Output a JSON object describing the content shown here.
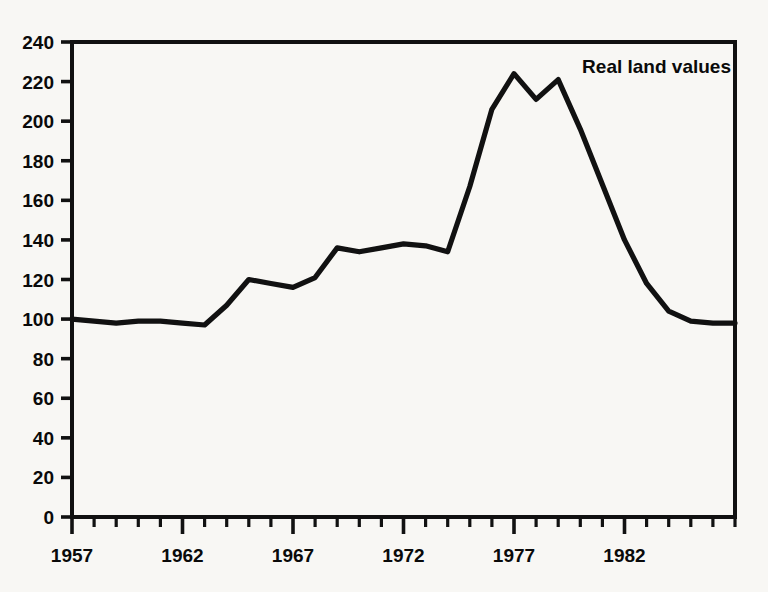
{
  "figure": {
    "background_color": "#f8f7f4",
    "ink_color": "#111111",
    "annotation": "Real land values"
  },
  "chart_data": {
    "type": "line",
    "title": "Real land values",
    "xlabel": "",
    "ylabel": "",
    "xlim": [
      1957,
      1987
    ],
    "ylim": [
      0,
      240
    ],
    "grid": false,
    "legend_position": "top-right (inline annotation)",
    "ytick_labels": [
      "0",
      "20",
      "40",
      "60",
      "80",
      "100",
      "120",
      "140",
      "160",
      "180",
      "200",
      "220",
      "240"
    ],
    "ytick_values": [
      0,
      20,
      40,
      60,
      80,
      100,
      120,
      140,
      160,
      180,
      200,
      220,
      240
    ],
    "xtick_labels": [
      "1957",
      "1962",
      "1967",
      "1972",
      "1977",
      "1982"
    ],
    "xtick_label_values": [
      1957,
      1962,
      1967,
      1972,
      1977,
      1982
    ],
    "xtick_minor_interval": 1,
    "xtick_major_interval": 5,
    "x": [
      1957,
      1958,
      1959,
      1960,
      1961,
      1962,
      1963,
      1964,
      1965,
      1966,
      1967,
      1968,
      1969,
      1970,
      1971,
      1972,
      1973,
      1974,
      1975,
      1976,
      1977,
      1978,
      1979,
      1980,
      1981,
      1982,
      1983,
      1984,
      1985,
      1986,
      1987
    ],
    "series": [
      {
        "name": "Real land values",
        "values": [
          100,
          99,
          98,
          99,
          99,
          98,
          97,
          107,
          120,
          118,
          116,
          121,
          136,
          134,
          136,
          138,
          137,
          134,
          167,
          206,
          224,
          211,
          221,
          196,
          168,
          140,
          118,
          104,
          99,
          98,
          98
        ]
      }
    ]
  }
}
